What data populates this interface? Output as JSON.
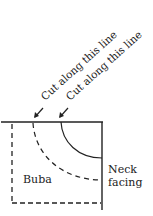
{
  "diagram": {
    "cut_labels": [
      "Cut along this line",
      "Cut along this line"
    ],
    "region_labels": {
      "buba": "Buba",
      "neck_line1": "Neck",
      "neck_line2": "facing"
    },
    "colors": {
      "line": "#222222",
      "background": "#ffffff"
    }
  }
}
